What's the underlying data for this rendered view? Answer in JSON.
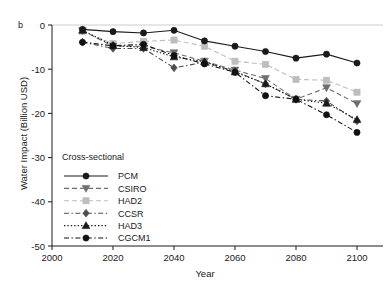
{
  "panel": {
    "label": "b"
  },
  "axes": {
    "xlabel": "Year",
    "ylabel": "Water Impact (Billion USD)",
    "xticks": [
      "2000",
      "2020",
      "2040",
      "2060",
      "2080",
      "2100"
    ],
    "yticks": [
      "0",
      "-10",
      "-20",
      "-30",
      "-40",
      "-50"
    ]
  },
  "legend": {
    "title": "Cross-sectional",
    "entries": [
      {
        "label": "PCM"
      },
      {
        "label": "CSIRO"
      },
      {
        "label": "HAD2"
      },
      {
        "label": "CCSR"
      },
      {
        "label": "HAD3"
      },
      {
        "label": "CGCM1"
      }
    ]
  },
  "chart_data": {
    "type": "line",
    "title": "",
    "subtitle": "",
    "xlabel": "Year",
    "ylabel": "Water Impact (Billion USD)",
    "xlim": [
      2000,
      2100
    ],
    "ylim": [
      -50,
      0
    ],
    "xticks": [
      2000,
      2020,
      2040,
      2060,
      2080,
      2100
    ],
    "yticks": [
      0,
      -10,
      -20,
      -30,
      -40,
      -50
    ],
    "grid": false,
    "legend_position": "lower-left",
    "legend_title": "Cross-sectional",
    "x": [
      2010,
      2020,
      2030,
      2040,
      2050,
      2060,
      2070,
      2080,
      2090,
      2100
    ],
    "series": [
      {
        "name": "PCM",
        "marker": "circle",
        "linestyle": "solid",
        "color": "#1a1a1a",
        "values": [
          -1.0,
          -1.5,
          -1.8,
          -1.2,
          -3.6,
          -4.8,
          -6.0,
          -7.5,
          -6.6,
          -8.6
        ]
      },
      {
        "name": "CSIRO",
        "marker": "triangle-down",
        "linestyle": "dashed",
        "color": "#6e6e6e",
        "values": [
          -1.3,
          -4.8,
          -4.8,
          -6.3,
          -8.2,
          -10.2,
          -12.1,
          -16.8,
          -14.2,
          -17.8
        ]
      },
      {
        "name": "HAD2",
        "marker": "square",
        "linestyle": "dashed",
        "color": "#bdbdbd",
        "values": [
          -1.4,
          -4.2,
          -3.7,
          -3.4,
          -4.8,
          -8.2,
          -8.9,
          -12.3,
          -12.5,
          -15.2
        ]
      },
      {
        "name": "CCSR",
        "marker": "diamond",
        "linestyle": "dash-dot",
        "color": "#4d4d4d",
        "values": [
          -3.9,
          -5.3,
          -5.3,
          -9.7,
          -8.4,
          -10.5,
          -13.3,
          -16.8,
          -17.2,
          -21.7
        ]
      },
      {
        "name": "HAD3",
        "marker": "triangle-up",
        "linestyle": "dotted",
        "color": "#1a1a1a",
        "values": [
          -1.2,
          -4.6,
          -5.1,
          -7.2,
          -8.3,
          -10.6,
          -13.3,
          -16.8,
          -17.7,
          -21.4
        ]
      },
      {
        "name": "CGCM1",
        "marker": "circle",
        "linestyle": "dash-dot",
        "color": "#111111",
        "values": [
          -3.9,
          -4.7,
          -4.4,
          -6.9,
          -8.8,
          -10.7,
          -16.0,
          -16.8,
          -20.3,
          -24.3
        ]
      }
    ]
  }
}
